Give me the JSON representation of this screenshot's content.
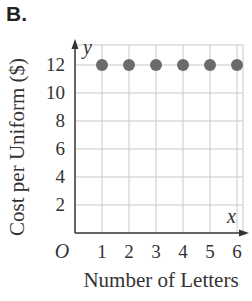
{
  "figure_label": "B.",
  "chart_data": {
    "type": "scatter",
    "title": "",
    "xlabel": "Number of Letters",
    "ylabel": "Cost per Uniform ($)",
    "x_axis_var": "x",
    "y_axis_var": "y",
    "origin_label": "O",
    "x": [
      1,
      2,
      3,
      4,
      5,
      6
    ],
    "y": [
      12,
      12,
      12,
      12,
      12,
      12
    ],
    "x_ticks": [
      "1",
      "2",
      "3",
      "4",
      "5",
      "6"
    ],
    "y_ticks": [
      "2",
      "4",
      "6",
      "8",
      "10",
      "12"
    ],
    "xlim": [
      0,
      6
    ],
    "ylim": [
      0,
      13
    ],
    "grid": true,
    "point_color": "#6b6b6b",
    "grid_color": "#c8c8c8"
  }
}
